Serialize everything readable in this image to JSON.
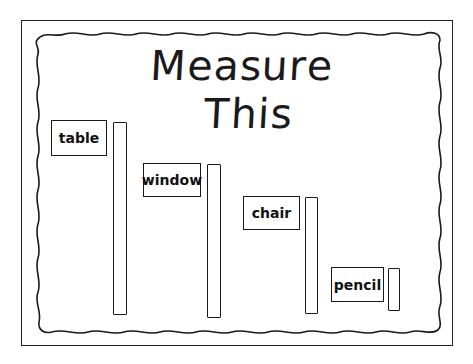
{
  "worksheet": {
    "title": "Measure This",
    "items": [
      {
        "label": "table",
        "box": {
          "x": 51,
          "y": 120,
          "w": 56,
          "h": 36
        },
        "bar": {
          "x": 113,
          "y": 122,
          "w": 14,
          "h": 193
        }
      },
      {
        "label": "window",
        "box": {
          "x": 143,
          "y": 163,
          "w": 58,
          "h": 34
        },
        "bar": {
          "x": 207,
          "y": 164,
          "w": 14,
          "h": 154
        }
      },
      {
        "label": "chair",
        "box": {
          "x": 243,
          "y": 196,
          "w": 57,
          "h": 34
        },
        "bar": {
          "x": 305,
          "y": 197,
          "w": 13,
          "h": 117
        }
      },
      {
        "label": "pencil",
        "box": {
          "x": 331,
          "y": 267,
          "w": 53,
          "h": 35
        },
        "bar": {
          "x": 388,
          "y": 268,
          "w": 12,
          "h": 43
        }
      }
    ]
  },
  "colors": {
    "ink": "#1a1a1a",
    "paper": "#ffffff"
  }
}
